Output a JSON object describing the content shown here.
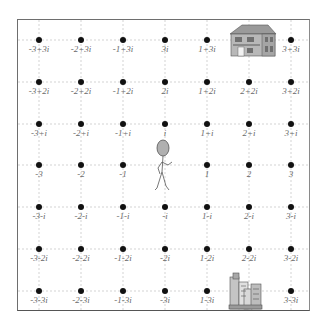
{
  "diagram": {
    "title": "",
    "type": "complex-plane-grid",
    "grid": {
      "columns_real": [
        -3,
        -2,
        -1,
        0,
        1,
        2,
        3
      ],
      "rows_imag": [
        3,
        2,
        1,
        0,
        -1,
        -2,
        -3
      ],
      "col_x": [
        39,
        81,
        123,
        165,
        207,
        249,
        291
      ],
      "row_y": [
        40,
        82,
        124,
        165,
        207,
        249,
        291
      ],
      "line_color": "#c8c8c8",
      "dot_color": "#111111",
      "label_color": "#6a6a6a"
    },
    "labels": [
      [
        "-3+3i",
        "-2+3i",
        "-1+3i",
        "3i",
        "1+3i",
        "2+3i",
        "3+3i"
      ],
      [
        "-3+2i",
        "-2+2i",
        "-1+2i",
        "2i",
        "1+2i",
        "2+2i",
        "3+2i"
      ],
      [
        "-3+i",
        "-2+i",
        "-1+i",
        "i",
        "1+i",
        "2+i",
        "3+i"
      ],
      [
        "-3",
        "-2",
        "-1",
        "0",
        "1",
        "2",
        "3"
      ],
      [
        "-3-i",
        "-2-i",
        "-1-i",
        "-i",
        "1-i",
        "2-i",
        "3-i"
      ],
      [
        "-3-2i",
        "-2-2i",
        "-1-2i",
        "-2i",
        "1-2i",
        "2-2i",
        "3-2i"
      ],
      [
        "-3-3i",
        "-2-3i",
        "-1-3i",
        "-3i",
        "1-3i",
        "2-3i",
        "3-3i"
      ]
    ],
    "hidden_points": [
      "2+3i",
      "0",
      "2-3i"
    ],
    "objects": [
      {
        "name": "house",
        "icon": "house-icon",
        "position": "2+3i"
      },
      {
        "name": "person",
        "icon": "person-icon",
        "position": "0"
      },
      {
        "name": "office-buildings",
        "icon": "office-buildings-icon",
        "position": "2-3i"
      }
    ]
  }
}
